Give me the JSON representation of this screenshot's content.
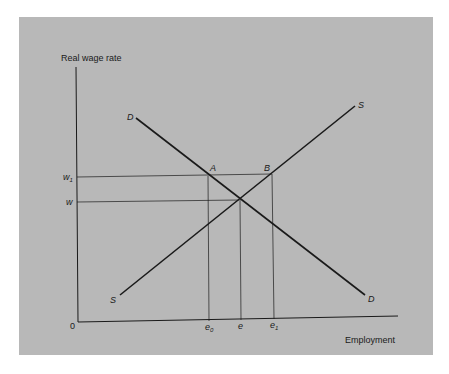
{
  "diagram": {
    "y_axis_label": "Real wage rate",
    "x_axis_label": "Employment",
    "origin_label": "0",
    "wage_levels": [
      {
        "label": "w",
        "sub": "1"
      },
      {
        "label": "w",
        "sub": ""
      }
    ],
    "employment_levels": [
      {
        "label": "e",
        "sub": "0"
      },
      {
        "label": "e",
        "sub": ""
      },
      {
        "label": "e",
        "sub": "1"
      }
    ],
    "points": {
      "a": "A",
      "b": "B"
    },
    "curves": {
      "demand_top": "D",
      "demand_bottom": "D",
      "supply_top": "S",
      "supply_bottom": "S"
    },
    "colors": {
      "background": "#b8b8b8",
      "line": "#1a1a1a"
    }
  }
}
